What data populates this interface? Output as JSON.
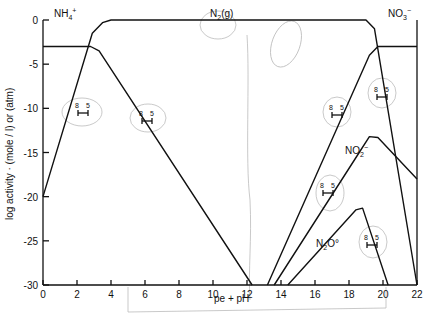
{
  "chart_data": {
    "type": "line",
    "title": "",
    "xlabel": "pe + pH",
    "ylabel": "log activity (mole / l) or (atm)",
    "xlim": [
      0,
      22
    ],
    "ylim": [
      -30,
      0
    ],
    "x_ticks": [
      "0",
      "2",
      "4",
      "6",
      "8",
      "10",
      "12",
      "14",
      "16",
      "18",
      "20",
      "22"
    ],
    "y_ticks": [
      "0",
      "-5",
      "-10",
      "-15",
      "-20",
      "-25",
      "-30"
    ],
    "grid": false,
    "series": [
      {
        "name": "N2(g)",
        "label": "N₂(g)",
        "points": [
          [
            0,
            -20
          ],
          [
            2.9,
            -1.5
          ],
          [
            3.5,
            -0.3
          ],
          [
            4,
            0
          ],
          [
            19,
            0
          ],
          [
            19.5,
            -1
          ],
          [
            22,
            -30
          ]
        ]
      },
      {
        "name": "NH4+",
        "label": "NH₄⁺",
        "points": [
          [
            0,
            -3
          ],
          [
            2.8,
            -3
          ],
          [
            3.3,
            -3.5
          ],
          [
            12.3,
            -30
          ]
        ]
      },
      {
        "name": "NO3-",
        "label": "NO₃⁻",
        "points": [
          [
            13.2,
            -30
          ],
          [
            19.2,
            -4
          ],
          [
            19.7,
            -3
          ],
          [
            22,
            -3
          ]
        ]
      },
      {
        "name": "NO2-",
        "label": "NO₂⁻",
        "points": [
          [
            13.6,
            -30
          ],
          [
            18.6,
            -15
          ],
          [
            19.2,
            -13.2
          ],
          [
            19.7,
            -13.3
          ],
          [
            22,
            -18
          ]
        ]
      },
      {
        "name": "N2O",
        "label": "N₂O°",
        "points": [
          [
            14.4,
            -30
          ],
          [
            18.4,
            -21.5
          ],
          [
            18.8,
            -21.3
          ],
          [
            20.3,
            -30
          ]
        ]
      }
    ],
    "annotations": [
      {
        "text": "8",
        "note": "pH 8 marker"
      },
      {
        "text": "5",
        "note": "pH 5 marker"
      }
    ]
  },
  "labels": {
    "n2": "N",
    "n2_sub": "2",
    "n2_suffix": "(g)",
    "nh4": "NH",
    "nh4_sub": "4",
    "nh4_sup": "+",
    "no3": "NO",
    "no3_sub": "3",
    "no3_sup": "−",
    "no2": "NO",
    "no2_sub": "2",
    "no2_sup": "−",
    "n2o": "N",
    "n2o_sub": "2",
    "n2o_suffix": "O°",
    "xlabel": "pe + pH",
    "ylabel": "log activity · (mole / l) or (atm)",
    "m8": "8",
    "m5": "5"
  }
}
